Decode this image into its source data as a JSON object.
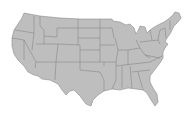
{
  "map": {
    "subject": "United States (contiguous) state boundaries",
    "style": "halftone dot pattern",
    "colors": {
      "background": "#ffffff",
      "land_fill": "#c8c8c8",
      "dot": "#9a9a9a",
      "state_border": "#7c7c7c"
    }
  }
}
